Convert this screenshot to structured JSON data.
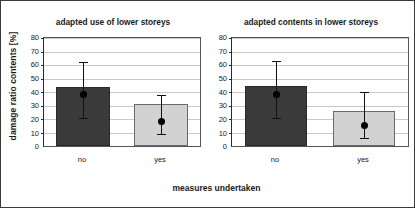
{
  "chart_data": [
    {
      "type": "bar",
      "title": "adapted use of lower storeys",
      "xlabel": "measures undertaken",
      "ylabel": "damage ratio contents [%]",
      "categories": [
        "no",
        "yes"
      ],
      "values": [
        44,
        31
      ],
      "markers": [
        38,
        18
      ],
      "error_low": [
        21,
        9
      ],
      "error_high": [
        62,
        38
      ],
      "ylim": [
        0,
        80
      ],
      "yticks": [
        0,
        10,
        20,
        30,
        40,
        50,
        60,
        70,
        80
      ],
      "grid": true,
      "legend": "none",
      "bar_colors": [
        "#3a3a3a",
        "#d2d2d2"
      ]
    },
    {
      "type": "bar",
      "title": "adapted contents in lower storeys",
      "xlabel": "measures undertaken",
      "ylabel": "damage ratio contents [%]",
      "categories": [
        "no",
        "yes"
      ],
      "values": [
        44.5,
        26
      ],
      "markers": [
        38,
        15
      ],
      "error_low": [
        21,
        6
      ],
      "error_high": [
        63,
        40
      ],
      "ylim": [
        0,
        80
      ],
      "yticks": [
        0,
        10,
        20,
        30,
        40,
        50,
        60,
        70,
        80
      ],
      "grid": true,
      "legend": "none",
      "bar_colors": [
        "#3a3a3a",
        "#d2d2d2"
      ]
    }
  ],
  "axes": {
    "ylabel": "damage ratio contents [%]",
    "xlabel": "measures undertaken",
    "ytick_labels": [
      "80",
      "70",
      "60",
      "50",
      "40",
      "30",
      "20",
      "10",
      "0"
    ]
  },
  "panel_left": {
    "title": "adapted use of lower storeys",
    "cat0": "no",
    "cat1": "yes"
  },
  "panel_right": {
    "title": "adapted contents in lower storeys",
    "cat0": "no",
    "cat1": "yes"
  }
}
